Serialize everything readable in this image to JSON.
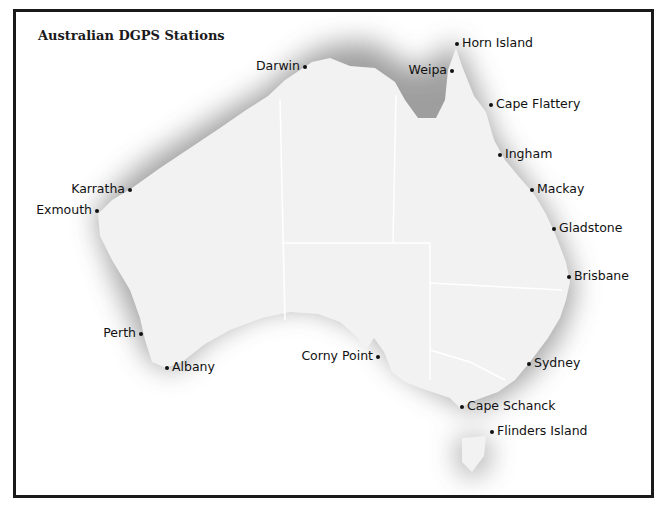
{
  "map": {
    "title": "Australian DGPS Stations",
    "colors": {
      "frame": "#1a1a1a",
      "land": "#f2f2f2",
      "shadow": "#8a8a8a",
      "borders": "#ffffff",
      "station": "#111111"
    },
    "stations": [
      {
        "name": "Darwin",
        "x": 305,
        "y": 67,
        "label_side": "left"
      },
      {
        "name": "Horn Island",
        "x": 457,
        "y": 44,
        "label_side": "right"
      },
      {
        "name": "Weipa",
        "x": 452,
        "y": 71,
        "label_side": "left"
      },
      {
        "name": "Cape Flattery",
        "x": 491,
        "y": 105,
        "label_side": "right"
      },
      {
        "name": "Ingham",
        "x": 500,
        "y": 155,
        "label_side": "right"
      },
      {
        "name": "Mackay",
        "x": 532,
        "y": 190,
        "label_side": "right"
      },
      {
        "name": "Gladstone",
        "x": 554,
        "y": 229,
        "label_side": "right"
      },
      {
        "name": "Brisbane",
        "x": 569,
        "y": 277,
        "label_side": "right"
      },
      {
        "name": "Karratha",
        "x": 130,
        "y": 190,
        "label_side": "left"
      },
      {
        "name": "Exmouth",
        "x": 97,
        "y": 211,
        "label_side": "left"
      },
      {
        "name": "Perth",
        "x": 141,
        "y": 334,
        "label_side": "left"
      },
      {
        "name": "Albany",
        "x": 167,
        "y": 368,
        "label_side": "right"
      },
      {
        "name": "Corny Point",
        "x": 378,
        "y": 357,
        "label_side": "left"
      },
      {
        "name": "Sydney",
        "x": 529,
        "y": 364,
        "label_side": "right"
      },
      {
        "name": "Cape Schanck",
        "x": 462,
        "y": 407,
        "label_side": "right"
      },
      {
        "name": "Flinders Island",
        "x": 492,
        "y": 432,
        "label_side": "right"
      }
    ]
  }
}
